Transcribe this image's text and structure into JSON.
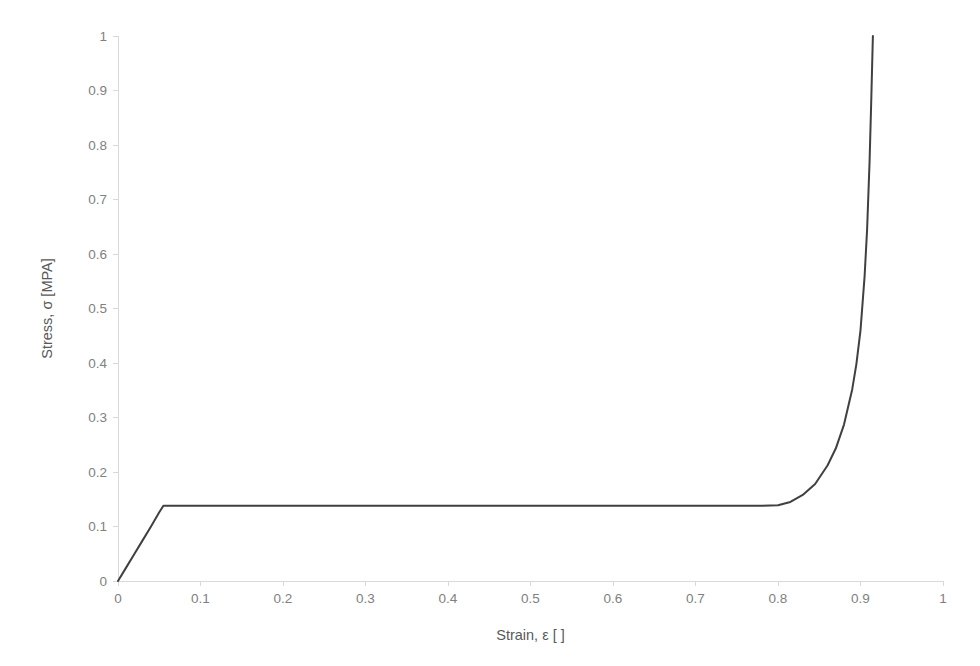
{
  "chart_data": {
    "type": "line",
    "title": "",
    "subtitle": "",
    "xlabel": "Strain, ε [ ]",
    "ylabel": "Stress, σ [MPA]",
    "xlim": [
      0,
      1
    ],
    "ylim": [
      0,
      1
    ],
    "grid": false,
    "legend": false,
    "legend_position": "none",
    "xticks": [
      "0",
      "0.1",
      "0.2",
      "0.3",
      "0.4",
      "0.5",
      "0.6",
      "0.7",
      "0.8",
      "0.9",
      "1"
    ],
    "xtick_values": [
      0,
      0.1,
      0.2,
      0.3,
      0.4,
      0.5,
      0.6,
      0.7,
      0.8,
      0.9,
      1
    ],
    "yticks": [
      "0",
      "0.1",
      "0.2",
      "0.3",
      "0.4",
      "0.5",
      "0.6",
      "0.7",
      "0.8",
      "0.9",
      "1"
    ],
    "ytick_values": [
      0,
      0.1,
      0.2,
      0.3,
      0.4,
      0.5,
      0.6,
      0.7,
      0.8,
      0.9,
      1
    ],
    "series": [
      {
        "name": "Stress-strain response",
        "color": "#404040",
        "linewidth": 2,
        "x": [
          0,
          0.01,
          0.02,
          0.03,
          0.04,
          0.05,
          0.055,
          0.1,
          0.2,
          0.3,
          0.4,
          0.5,
          0.6,
          0.7,
          0.75,
          0.78,
          0.8,
          0.815,
          0.83,
          0.845,
          0.86,
          0.87,
          0.88,
          0.89,
          0.895,
          0.9,
          0.905,
          0.908,
          0.911,
          0.913,
          0.915
        ],
        "y": [
          0,
          0.025,
          0.05,
          0.075,
          0.1,
          0.126,
          0.138,
          0.138,
          0.138,
          0.138,
          0.138,
          0.138,
          0.138,
          0.138,
          0.138,
          0.138,
          0.139,
          0.145,
          0.158,
          0.178,
          0.212,
          0.243,
          0.287,
          0.352,
          0.398,
          0.46,
          0.56,
          0.645,
          0.77,
          0.88,
          1.0
        ]
      }
    ],
    "annotations": {
      "elastic_modulus_note": "",
      "plateau_stress": 0.138,
      "plateau_start_strain": 0.055,
      "densification_start_strain": 0.8,
      "final_strain": 0.915,
      "final_stress": 1.0
    },
    "axis_color": "#d9d9d9",
    "tick_label_color": "#7f7f7f",
    "axis_title_color": "#595959",
    "background_color": "#ffffff"
  },
  "layout": {
    "plot_left": 118,
    "plot_right": 943,
    "plot_top": 36,
    "plot_bottom": 581
  }
}
